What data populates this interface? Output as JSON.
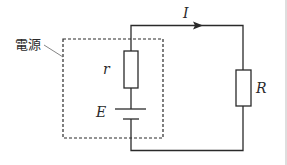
{
  "diagram": {
    "type": "circuit",
    "labels": {
      "power_source": "電源",
      "current": "I",
      "internal_resistance": "r",
      "emf": "E",
      "load_resistance": "R"
    },
    "components": [
      {
        "id": "r",
        "kind": "resistor",
        "label": "r",
        "location": "inside power source box, upper"
      },
      {
        "id": "E",
        "kind": "battery",
        "label": "E",
        "location": "inside power source box, lower"
      },
      {
        "id": "R",
        "kind": "resistor",
        "label": "R",
        "location": "external right branch"
      }
    ],
    "current_arrow": {
      "label": "I",
      "direction": "right",
      "location": "top wire"
    },
    "power_source_box": {
      "style": "dashed",
      "label": "電源"
    },
    "colors": {
      "line": "#2a2a2a",
      "leader": "#666666",
      "background": "#ffffff"
    }
  }
}
